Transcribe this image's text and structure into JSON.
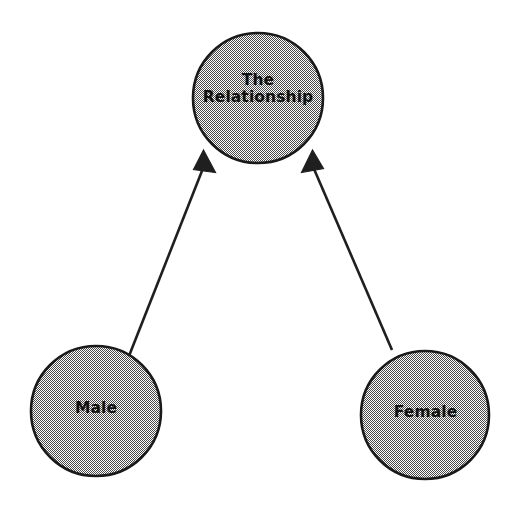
{
  "diagram": {
    "type": "node-link-diagram",
    "background_color": "#ffffff",
    "node_fill_pattern": "checkerboard-dither-gray",
    "node_fill_color": "#9a9a9a",
    "node_border_color": "#1a1a1a",
    "arrow_color": "#1a1a1a",
    "nodes": [
      {
        "id": "relationship",
        "label": "The\nRelationship",
        "label_lines": [
          "The",
          "Relationship"
        ],
        "cx": 258,
        "cy": 98,
        "r": 66
      },
      {
        "id": "male",
        "label": "Male",
        "label_lines": [
          "Male"
        ],
        "cx": 96,
        "cy": 411,
        "r": 66
      },
      {
        "id": "female",
        "label": "Female",
        "label_lines": [
          "Female"
        ],
        "cx": 425,
        "cy": 415,
        "r": 65
      }
    ],
    "edges": [
      {
        "id": "male-to-relationship",
        "from": "male",
        "to": "relationship",
        "arrowhead": "filled-triangle",
        "direction": "up-right"
      },
      {
        "id": "female-to-relationship",
        "from": "female",
        "to": "relationship",
        "arrowhead": "filled-triangle",
        "direction": "up-left"
      }
    ]
  }
}
